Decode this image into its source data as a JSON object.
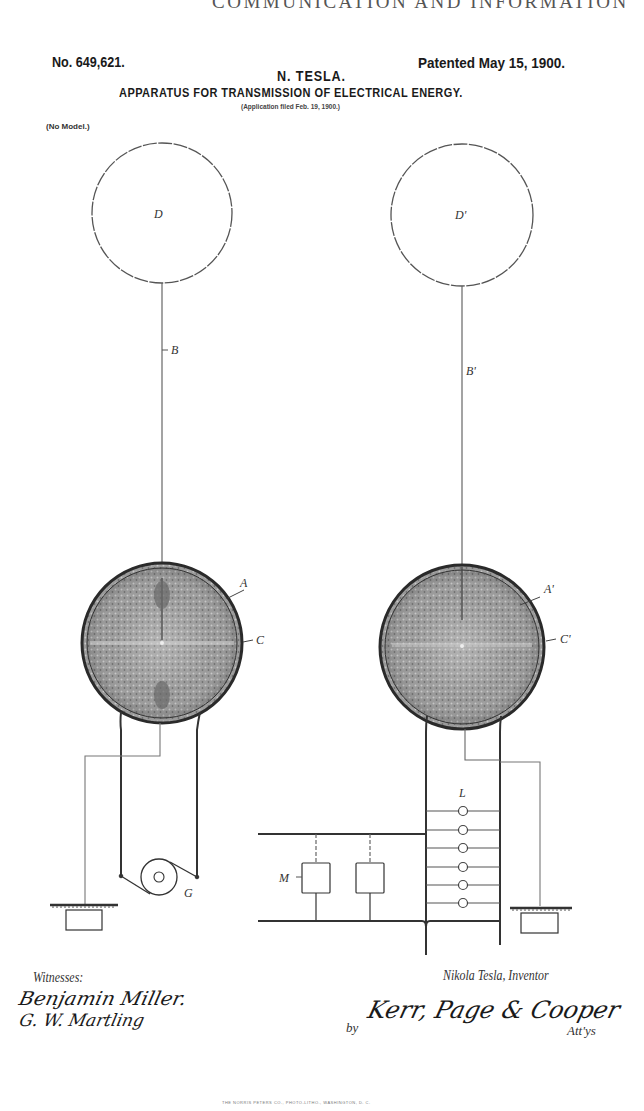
{
  "page": {
    "running_head": "COMMUNICATION AND INFORMATION"
  },
  "patent": {
    "number": "No. 649,621.",
    "date": "Patented May 15, 1900.",
    "inventor": "N. TESLA.",
    "title": "APPARATUS FOR TRANSMISSION OF ELECTRICAL ENERGY.",
    "application": "(Application filed Feb. 19, 1900.)",
    "model_note": "(No Model.)"
  },
  "figure": {
    "labels": {
      "terminal_left": "D",
      "terminal_right": "D'",
      "mast_left": "B",
      "mast_right": "B'",
      "coil_left": "A",
      "coil_right": "A'",
      "secondary_left": "C",
      "secondary_right": "C'",
      "generator": "G",
      "lamps": "L",
      "motors": "M"
    },
    "lamp_count": 6,
    "motor_count": 2
  },
  "signatures": {
    "witnesses_label": "Witnesses:",
    "witness_1": "Benjamin Miller.",
    "witness_2": "G. W. Martling",
    "inventor": "Nikola Tesla,  Inventor",
    "by": "by",
    "attorneys": "Kerr, Page & Cooper",
    "attorneys_suffix": "Att'ys"
  },
  "footer": {
    "imprint": "THE NORRIS PETERS CO., PHOTO-LITHO., WASHINGTON, D. C."
  }
}
